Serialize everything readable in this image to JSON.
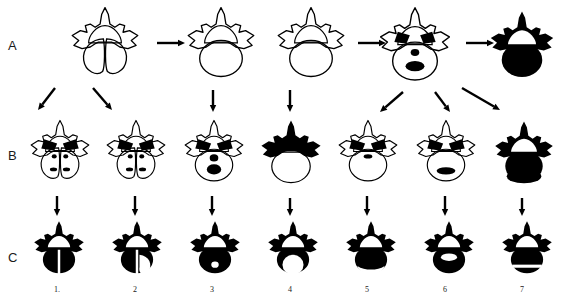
{
  "figure": {
    "type": "scientific-diagram",
    "background_color": "#ffffff",
    "ink_color": "#000000",
    "width": 567,
    "height": 297
  },
  "row_labels": [
    {
      "id": "A",
      "text": "A",
      "x": 8,
      "y": 38
    },
    {
      "id": "B",
      "text": "B",
      "x": 8,
      "y": 148
    },
    {
      "id": "C",
      "text": "C",
      "x": 8,
      "y": 250
    }
  ],
  "column_numbers": [
    {
      "text": "1.",
      "cx": 57
    },
    {
      "text": "2",
      "cx": 135
    },
    {
      "text": "3",
      "cx": 212
    },
    {
      "text": "4",
      "cx": 290
    },
    {
      "text": "5",
      "cx": 367
    },
    {
      "text": "6",
      "cx": 445
    },
    {
      "text": "7",
      "cx": 522
    }
  ],
  "cells": [
    {
      "name": "vertebra-A1",
      "row": "A",
      "col": 1,
      "x": 62,
      "y": 6,
      "w": 86,
      "h": 82,
      "style": "outline",
      "variant": "bifid-split",
      "fill": "none"
    },
    {
      "name": "vertebra-A2",
      "row": "A",
      "col": 3,
      "x": 178,
      "y": 6,
      "w": 86,
      "h": 82,
      "style": "outline",
      "variant": "narrow-body-foramen",
      "fill": "none"
    },
    {
      "name": "vertebra-A3",
      "row": "A",
      "col": 4,
      "x": 268,
      "y": 6,
      "w": 86,
      "h": 82,
      "style": "outline",
      "variant": "round-body",
      "fill": "none"
    },
    {
      "name": "vertebra-A4",
      "row": "A",
      "col": 5,
      "x": 370,
      "y": 6,
      "w": 90,
      "h": 86,
      "style": "outline",
      "variant": "dark-pedicles-spots",
      "fill": "none"
    },
    {
      "name": "vertebra-A5",
      "row": "A",
      "col": 7,
      "x": 482,
      "y": 10,
      "w": 80,
      "h": 78,
      "style": "solid",
      "variant": "fully-ossified",
      "fill": "#000000"
    },
    {
      "name": "vertebra-B1",
      "row": "B",
      "col": 1,
      "x": 24,
      "y": 118,
      "w": 72,
      "h": 74,
      "style": "outline",
      "variant": "bifid-split-dark-laminae",
      "fill": "none"
    },
    {
      "name": "vertebra-B2",
      "row": "B",
      "col": 2,
      "x": 100,
      "y": 118,
      "w": 72,
      "h": 74,
      "style": "outline",
      "variant": "bifid-asymmetric-dark-laminae",
      "fill": "none"
    },
    {
      "name": "vertebra-B3",
      "row": "B",
      "col": 3,
      "x": 178,
      "y": 118,
      "w": 72,
      "h": 74,
      "style": "outline",
      "variant": "two-dark-ovals-in-body",
      "fill": "none"
    },
    {
      "name": "vertebra-B4",
      "row": "B",
      "col": 4,
      "x": 254,
      "y": 118,
      "w": 74,
      "h": 76,
      "style": "mixed",
      "variant": "black-arch-white-body",
      "fill": "#000000"
    },
    {
      "name": "vertebra-B5",
      "row": "B",
      "col": 5,
      "x": 332,
      "y": 118,
      "w": 72,
      "h": 74,
      "style": "outline",
      "variant": "small-dark-band",
      "fill": "none"
    },
    {
      "name": "vertebra-B6",
      "row": "B",
      "col": 6,
      "x": 410,
      "y": 118,
      "w": 72,
      "h": 74,
      "style": "outline",
      "variant": "dark-oval-lower-body",
      "fill": "none"
    },
    {
      "name": "vertebra-B7",
      "row": "B",
      "col": 7,
      "x": 488,
      "y": 118,
      "w": 72,
      "h": 76,
      "style": "solid",
      "variant": "black-arch-split-body",
      "fill": "#000000"
    },
    {
      "name": "vertebra-C1",
      "row": "C",
      "col": 1,
      "x": 24,
      "y": 220,
      "w": 70,
      "h": 62,
      "style": "solid",
      "variant": "black-cleft-body",
      "fill": "#000000"
    },
    {
      "name": "vertebra-C2",
      "row": "C",
      "col": 2,
      "x": 102,
      "y": 220,
      "w": 70,
      "h": 62,
      "style": "solid",
      "variant": "black-with-white-lobe",
      "fill": "#000000"
    },
    {
      "name": "vertebra-C3",
      "row": "C",
      "col": 3,
      "x": 180,
      "y": 220,
      "w": 70,
      "h": 62,
      "style": "solid",
      "variant": "black-small-white-dot",
      "fill": "#000000"
    },
    {
      "name": "vertebra-C4",
      "row": "C",
      "col": 4,
      "x": 258,
      "y": 220,
      "w": 70,
      "h": 62,
      "style": "solid",
      "variant": "black-large-white-circle",
      "fill": "#000000"
    },
    {
      "name": "vertebra-C5",
      "row": "C",
      "col": 5,
      "x": 336,
      "y": 220,
      "w": 70,
      "h": 62,
      "style": "solid",
      "variant": "black-white-lower-crescent",
      "fill": "#000000"
    },
    {
      "name": "vertebra-C6",
      "row": "C",
      "col": 6,
      "x": 414,
      "y": 220,
      "w": 70,
      "h": 62,
      "style": "solid",
      "variant": "black-white-notch",
      "fill": "#000000"
    },
    {
      "name": "vertebra-C7",
      "row": "C",
      "col": 7,
      "x": 492,
      "y": 220,
      "w": 70,
      "h": 62,
      "style": "solid",
      "variant": "black-white-stripe",
      "fill": "#000000"
    }
  ],
  "arrows": [
    {
      "name": "arrow-A1-to-A2",
      "x1": 157,
      "y1": 43,
      "x2": 185,
      "y2": 43
    },
    {
      "name": "arrow-A3-to-A4",
      "x1": 358,
      "y1": 43,
      "x2": 386,
      "y2": 43
    },
    {
      "name": "arrow-A4-to-A5",
      "x1": 466,
      "y1": 43,
      "x2": 494,
      "y2": 43
    },
    {
      "name": "arrow-A1-to-B1",
      "x1": 55,
      "y1": 88,
      "x2": 38,
      "y2": 110
    },
    {
      "name": "arrow-A1-to-B2",
      "x1": 93,
      "y1": 88,
      "x2": 112,
      "y2": 110
    },
    {
      "name": "arrow-A2-to-B3",
      "x1": 213,
      "y1": 90,
      "x2": 213,
      "y2": 112
    },
    {
      "name": "arrow-A3-to-B4",
      "x1": 290,
      "y1": 90,
      "x2": 290,
      "y2": 112
    },
    {
      "name": "arrow-A4-to-B5",
      "x1": 403,
      "y1": 92,
      "x2": 380,
      "y2": 112
    },
    {
      "name": "arrow-A4-to-B6",
      "x1": 435,
      "y1": 92,
      "x2": 450,
      "y2": 112
    },
    {
      "name": "arrow-A4-to-B7",
      "x1": 462,
      "y1": 88,
      "x2": 500,
      "y2": 110
    },
    {
      "name": "arrow-B1-to-C1",
      "x1": 57,
      "y1": 196,
      "x2": 57,
      "y2": 216
    },
    {
      "name": "arrow-B2-to-C2",
      "x1": 135,
      "y1": 196,
      "x2": 135,
      "y2": 216
    },
    {
      "name": "arrow-B3-to-C3",
      "x1": 212,
      "y1": 196,
      "x2": 212,
      "y2": 216
    },
    {
      "name": "arrow-B4-to-C4",
      "x1": 290,
      "y1": 198,
      "x2": 290,
      "y2": 216
    },
    {
      "name": "arrow-B5-to-C5",
      "x1": 367,
      "y1": 196,
      "x2": 367,
      "y2": 216
    },
    {
      "name": "arrow-B6-to-C6",
      "x1": 445,
      "y1": 196,
      "x2": 445,
      "y2": 216
    },
    {
      "name": "arrow-B7-to-C7",
      "x1": 522,
      "y1": 198,
      "x2": 522,
      "y2": 216
    }
  ]
}
